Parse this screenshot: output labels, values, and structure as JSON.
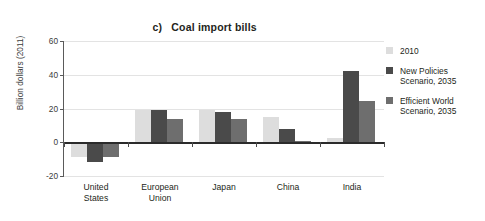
{
  "chart_data": {
    "type": "bar",
    "title": "Coal import bills",
    "title_index": "c)",
    "xlabel": "",
    "ylabel": "Billion dollars (2011)",
    "ylim": [
      -20,
      60
    ],
    "yticks": [
      60,
      40,
      20,
      0,
      -20
    ],
    "ytick_labels": [
      "60",
      "40",
      "20",
      "0",
      "-20"
    ],
    "grid": true,
    "legend_position": "right",
    "categories": [
      "United States",
      "European Union",
      "Japan",
      "China",
      "India"
    ],
    "category_labels": [
      "United\nStates",
      "European\nUnion",
      "Japan",
      "China",
      "India"
    ],
    "series": [
      {
        "name": "2010",
        "color": "#dddddd",
        "values": [
          -9.0,
          19.3,
          19.2,
          14.8,
          2.6
        ]
      },
      {
        "name": "New Policies Scenario, 2035",
        "label_lines": "New Policies\nScenario, 2035",
        "color": "#4a4a4a",
        "values": [
          -11.8,
          18.9,
          17.8,
          7.8,
          42.5
        ]
      },
      {
        "name": "Efficient World Scenario, 2035",
        "label_lines": "Efficient World\nScenario, 2035",
        "color": "#6e6e6e",
        "values": [
          -9.0,
          13.5,
          13.6,
          0.5,
          24.2
        ]
      }
    ]
  },
  "legend": {
    "items": [
      {
        "label": "2010",
        "color": "#dddddd"
      },
      {
        "label": "New Policies\nScenario, 2035",
        "color": "#4a4a4a"
      },
      {
        "label": "Efficient World\nScenario, 2035",
        "color": "#6e6e6e"
      }
    ]
  },
  "colors": {
    "axis": "#5a5a5a",
    "zero_line": "#2b2b2b",
    "grid": "#e3e3e3",
    "text": "#231f20",
    "background": "#ffffff"
  }
}
